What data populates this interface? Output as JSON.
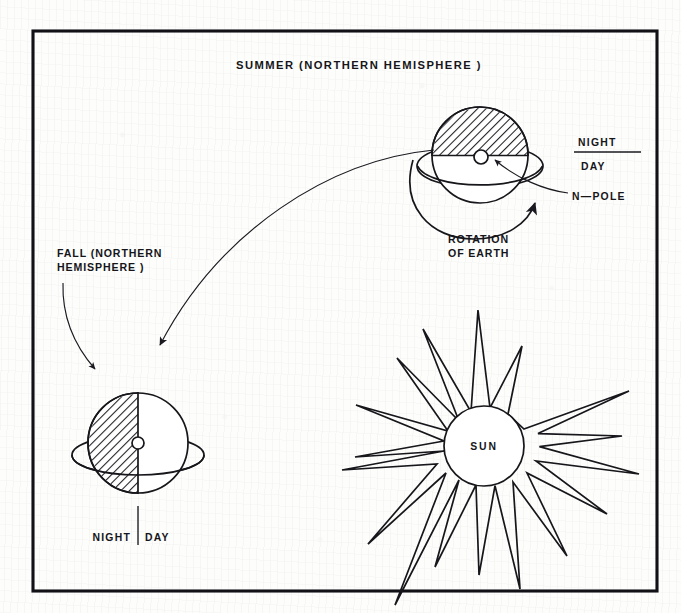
{
  "figure": {
    "kind": "seasons-earth-sun-diagram",
    "background_color": "#fdfdfb",
    "ink_color": "#16161b",
    "frame": {
      "present": true,
      "x": 33,
      "y": 31,
      "width": 624,
      "height": 560
    }
  },
  "labels": {
    "summer_title": "SUMMER  (NORTHERN  HEMISPHERE )",
    "fall_title_line1": "FALL (NORTHERN",
    "fall_title_line2": "HEMISPHERE )",
    "rotation_line1": "ROTATION",
    "rotation_line2": "OF EARTH",
    "night_upper": "NIGHT",
    "day_upper": "DAY",
    "n_pole": "N—POLE",
    "night_lower": "NIGHT",
    "day_lower": "DAY",
    "sun": "SUN"
  },
  "objects": {
    "summer_earth": {
      "name": "summer-earth",
      "center_x": 480,
      "center_y": 155,
      "radius": 48,
      "terminator": "horizontal",
      "shaded_side": "top",
      "shaded_meaning": "night",
      "lit_meaning": "day",
      "has_axis_ring": true,
      "pole_marker": {
        "x": 481,
        "y": 157,
        "radius": 7,
        "label": "N—POLE"
      }
    },
    "fall_earth": {
      "name": "fall-earth",
      "center_x": 138,
      "center_y": 443,
      "radius": 50,
      "terminator": "vertical",
      "shaded_side": "left",
      "shaded_meaning": "night",
      "lit_meaning": "day",
      "has_axis_ring": true,
      "pole_marker": {
        "x": 138,
        "y": 443,
        "radius": 6
      }
    },
    "sun": {
      "name": "sun",
      "center_x": 484,
      "center_y": 446,
      "radius": 40,
      "ray_count": 14,
      "label": "SUN"
    },
    "rotation_arrow": {
      "name": "rotation-of-earth-arrow",
      "direction": "counterclockwise-sweep-to-upper-right",
      "label": "ROTATION OF EARTH"
    },
    "orbit_arrow": {
      "name": "summer-to-fall-orbit-arrow",
      "from": "summer-earth",
      "to": "fall-earth"
    },
    "fall_pointer_arrow": {
      "name": "fall-label-pointer-arrow",
      "from": "fall-label",
      "to": "fall-earth"
    },
    "night_day_upper_divider": {
      "name": "night-day-divider-upper",
      "orientation": "horizontal"
    },
    "night_day_lower_divider": {
      "name": "night-day-divider-lower",
      "orientation": "vertical"
    }
  }
}
